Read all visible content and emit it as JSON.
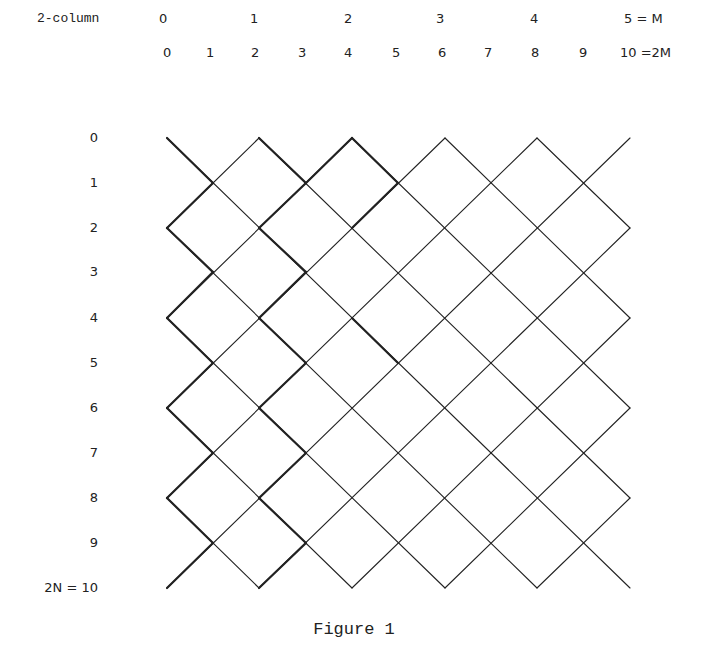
{
  "header": {
    "top_row_label": "2-column",
    "top_row_ticks": [
      "0",
      "1",
      "2",
      "3",
      "4",
      "5 = M"
    ],
    "second_row_ticks": [
      "0",
      "1",
      "2",
      "3",
      "4",
      "5",
      "6",
      "7",
      "8",
      "9",
      "10 =2M"
    ]
  },
  "rows": {
    "labels": [
      "0",
      "1",
      "2",
      "3",
      "4",
      "5",
      "6",
      "7",
      "8",
      "9",
      "2N = 10"
    ]
  },
  "lattice": {
    "columns": 10,
    "rows": 10,
    "line_color": "#222222",
    "description": "Diagonal diamond lattice; thick path segments on the left portion"
  },
  "caption": "Figure 1"
}
